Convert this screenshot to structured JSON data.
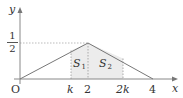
{
  "figure": {
    "type": "coordinate-diagram",
    "axes": {
      "x_label": "x",
      "y_label": "y",
      "origin_label": "O"
    },
    "y_ticks": [
      {
        "numerator": "1",
        "denominator": "2",
        "value": 0.5
      }
    ],
    "x_ticks": [
      {
        "label": "k",
        "italic": true
      },
      {
        "label": "2",
        "italic": false
      },
      {
        "label": "2k",
        "italic": true
      },
      {
        "label": "4",
        "italic": false
      }
    ],
    "graph": {
      "description": "Triangle (tent) function from O to peak (2, 1/2) to (4, 0)",
      "vertices": [
        [
          0,
          0
        ],
        [
          2,
          0.5
        ],
        [
          4,
          0
        ]
      ]
    },
    "regions": [
      {
        "name": "S",
        "subscript": "1",
        "from": "k",
        "to": "2"
      },
      {
        "name": "S",
        "subscript": "2",
        "from": "2",
        "to": "2k"
      }
    ],
    "colors": {
      "axis": "#888888",
      "curve": "#777777",
      "dashed": "#999999",
      "shade": "#ececec",
      "text": "#333333"
    }
  }
}
